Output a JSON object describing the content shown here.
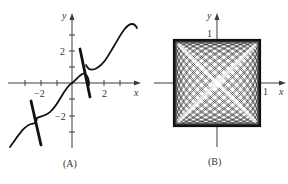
{
  "figure": {
    "panels": [
      {
        "caption": "(A)",
        "x_label": "x",
        "y_label": "y",
        "x_tick_labels": [
          "−2",
          "2"
        ],
        "y_tick_labels": [
          "2",
          "−2"
        ]
      },
      {
        "caption": "(B)",
        "x_label": "x",
        "y_label": "y",
        "x_tick_labels": [
          "1"
        ],
        "y_tick_labels": [
          "1"
        ]
      }
    ]
  },
  "chart_data": [
    {
      "type": "line",
      "title": "(A)",
      "xlabel": "x",
      "ylabel": "y",
      "xlim": [
        -4,
        4.2
      ],
      "ylim": [
        -4,
        4.4
      ],
      "x_ticks": [
        -3,
        -2,
        -1,
        0,
        1,
        2,
        3
      ],
      "y_ticks": [
        -3,
        -2,
        -1,
        0,
        1,
        2,
        3
      ],
      "x_tick_labels": {
        "-2": "−2",
        "2": "2"
      },
      "y_tick_labels": {
        "2": "2",
        "-2": "−2"
      },
      "grid": false,
      "series": [
        {
          "name": "curve",
          "x": [
            -3.9,
            -3.2,
            -2.4,
            -2.0,
            -1.5,
            -1.0,
            -0.5,
            0,
            0.6,
            1.0
          ],
          "y": [
            -4.0,
            -3.2,
            -2.6,
            -2.2,
            -1.8,
            -1.3,
            -0.5,
            0.0,
            0.7,
            -0.1
          ]
        },
        {
          "name": "curve-upper",
          "x": [
            0.9,
            1.2,
            2.0,
            2.5,
            3.0,
            3.6,
            4.0
          ],
          "y": [
            1.0,
            0.8,
            1.4,
            2.0,
            3.0,
            3.7,
            3.5
          ]
        },
        {
          "name": "steep-segment-left",
          "x": [
            -2.6,
            -2.0
          ],
          "y": [
            -1.0,
            -4.0
          ]
        },
        {
          "name": "steep-segment-right",
          "x": [
            0.5,
            1.2
          ],
          "y": [
            2.2,
            -0.9
          ]
        }
      ]
    },
    {
      "type": "line",
      "title": "(B)",
      "xlabel": "x",
      "ylabel": "y",
      "xlim": [
        -1.5,
        1.6
      ],
      "ylim": [
        -1.5,
        1.6
      ],
      "x_tick_labels": {
        "1": "1"
      },
      "y_tick_labels": {
        "1": "1"
      },
      "grid": false,
      "description": "Dense parametric curve filling the square [-1,1]×[-1,1] with diagonal X-shaped light bands",
      "bounds": {
        "xmin": -1,
        "xmax": 1,
        "ymin": -1,
        "ymax": 1
      }
    }
  ]
}
